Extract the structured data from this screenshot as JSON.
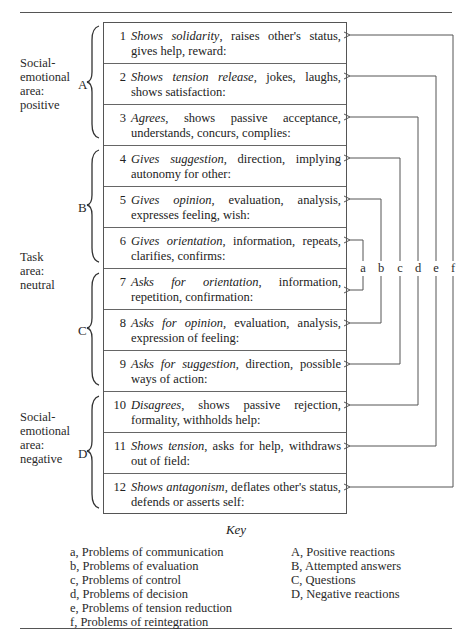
{
  "areas": [
    {
      "label": "Social-\nemotional\narea:\npositive",
      "top": 56
    },
    {
      "label": "Task\narea:\nneutral",
      "top": 250
    },
    {
      "label": "Social-\nemotional\narea:\nnegative",
      "top": 410
    }
  ],
  "groups": [
    {
      "letter": "A",
      "rows": [
        1,
        2,
        3
      ],
      "name": "Positive reactions"
    },
    {
      "letter": "B",
      "rows": [
        4,
        5,
        6
      ],
      "name": "Attempted answers"
    },
    {
      "letter": "C",
      "rows": [
        7,
        8,
        9
      ],
      "name": "Questions"
    },
    {
      "letter": "D",
      "rows": [
        10,
        11,
        12
      ],
      "name": "Negative reactions"
    }
  ],
  "categories": [
    {
      "num": "1",
      "italic": "Shows solidarity",
      "rest": ", raises other's status, gives help, reward:"
    },
    {
      "num": "2",
      "italic": "Shows tension release",
      "rest": ", jokes, laughs, shows satisfaction:"
    },
    {
      "num": "3",
      "italic": "Agrees",
      "rest": ", shows passive acceptance, understands, concurs, complies:"
    },
    {
      "num": "4",
      "italic": "Gives suggestion",
      "rest": ", direction, implying autonomy for other:"
    },
    {
      "num": "5",
      "italic": "Gives opinion",
      "rest": ", evaluation, analysis, expresses feeling, wish:"
    },
    {
      "num": "6",
      "italic": "Gives orientation",
      "rest": ", information, repeats, clarifies, confirms:"
    },
    {
      "num": "7",
      "italic": "Asks for orientation",
      "rest": ", information, repetition, confirmation:"
    },
    {
      "num": "8",
      "italic": "Asks for opinion",
      "rest": ", evaluation, analysis, expression of feeling:"
    },
    {
      "num": "9",
      "italic": "Asks for suggestion",
      "rest": ", direction, possible ways of action:"
    },
    {
      "num": "10",
      "italic": "Disagrees",
      "rest": ", shows passive rejection, formality, withholds help:"
    },
    {
      "num": "11",
      "italic": "Shows tension",
      "rest": ", asks for help, withdraws out of field:"
    },
    {
      "num": "12",
      "italic": "Shows antagonism",
      "rest": ", deflates other's status, defends or asserts self:"
    }
  ],
  "connectors": [
    {
      "letter": "a",
      "x": 363,
      "rows": [
        6,
        7
      ]
    },
    {
      "letter": "b",
      "x": 381,
      "rows": [
        5,
        8
      ]
    },
    {
      "letter": "c",
      "x": 400,
      "rows": [
        4,
        9
      ]
    },
    {
      "letter": "d",
      "x": 418,
      "rows": [
        3,
        10
      ]
    },
    {
      "letter": "e",
      "x": 436,
      "rows": [
        2,
        11
      ]
    },
    {
      "letter": "f",
      "x": 453,
      "rows": [
        1,
        12
      ]
    }
  ],
  "key": {
    "title": "Key",
    "left": [
      "a, Problems of communication",
      "b, Problems of evaluation",
      "c, Problems of control",
      "d, Problems of decision",
      "e, Problems of tension reduction",
      "f, Problems of reintegration"
    ],
    "right": [
      "A, Positive reactions",
      "B, Attempted answers",
      "C, Questions",
      "D, Negative reactions"
    ]
  },
  "colors": {
    "line": "#555555",
    "text": "#2a2a2a"
  }
}
